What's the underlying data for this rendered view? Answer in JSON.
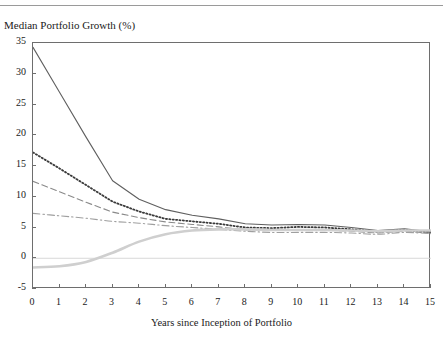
{
  "page_header": "",
  "axis": {
    "ylabel": "Median Portfolio Growth (%)",
    "xlabel": "Years since Inception of Portfolio",
    "yticks": [
      "35",
      "30",
      "25",
      "20",
      "15",
      "10",
      "5",
      "0",
      "-5"
    ],
    "xticks": [
      "0",
      "1",
      "2",
      "3",
      "4",
      "5",
      "6",
      "7",
      "8",
      "9",
      "10",
      "11",
      "12",
      "13",
      "14",
      "15"
    ]
  },
  "colors": {
    "solid": "#5f5f5f",
    "dotted": "#3a3a3a",
    "dashed": "#8a8a8a",
    "dashdot": "#9f9f9f",
    "thick_light": "#cfcfcf",
    "frame": "#6e6e6e",
    "zero_line": "#d8d8d8"
  },
  "chart_data": {
    "type": "line",
    "title": "",
    "xlabel": "Years since Inception of Portfolio",
    "ylabel": "Median Portfolio Growth (%)",
    "xlim": [
      0,
      15
    ],
    "ylim": [
      -5,
      35
    ],
    "ytick_step": 5,
    "grid": false,
    "legend": "none",
    "x": [
      0,
      1,
      2,
      3,
      4,
      5,
      6,
      7,
      8,
      9,
      10,
      11,
      12,
      13,
      14,
      15
    ],
    "series": [
      {
        "name": "solid-line",
        "style": "solid",
        "color": "#5f5f5f",
        "values": [
          34.3,
          27.0,
          19.7,
          12.6,
          9.6,
          7.9,
          7.0,
          6.4,
          5.6,
          5.4,
          5.5,
          5.4,
          5.0,
          4.5,
          4.8,
          4.3
        ]
      },
      {
        "name": "dotted-line",
        "style": "dotted",
        "color": "#3a3a3a",
        "values": [
          17.2,
          14.6,
          11.9,
          9.2,
          7.6,
          6.4,
          6.0,
          5.6,
          5.0,
          4.9,
          5.1,
          5.0,
          4.7,
          4.3,
          4.6,
          4.2
        ]
      },
      {
        "name": "dashed-line",
        "style": "dashed",
        "color": "#8a8a8a",
        "values": [
          12.5,
          10.8,
          9.1,
          7.5,
          6.6,
          5.9,
          5.5,
          5.1,
          4.6,
          4.5,
          4.6,
          4.6,
          4.4,
          4.1,
          4.4,
          4.1
        ]
      },
      {
        "name": "dash-dot-line",
        "style": "dashdot",
        "color": "#9f9f9f",
        "values": [
          7.3,
          6.9,
          6.5,
          6.0,
          5.7,
          5.3,
          5.0,
          4.7,
          4.4,
          4.2,
          4.2,
          4.2,
          4.1,
          3.9,
          4.2,
          4.0
        ]
      },
      {
        "name": "thick-light-line",
        "style": "solid-thick",
        "color": "#cfcfcf",
        "values": [
          -1.5,
          -1.3,
          -0.6,
          0.9,
          2.7,
          3.9,
          4.5,
          4.7,
          4.7,
          4.6,
          4.6,
          4.6,
          4.5,
          4.4,
          4.5,
          4.5
        ]
      }
    ]
  }
}
